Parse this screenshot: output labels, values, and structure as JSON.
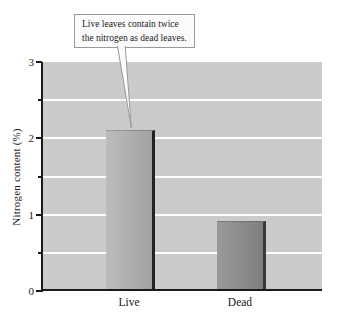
{
  "callout": {
    "lines": [
      "Live leaves contain twice",
      "the nitrogen as dead leaves."
    ]
  },
  "chart_data": {
    "type": "bar",
    "categories": [
      "Live",
      "Dead"
    ],
    "values": [
      2.1,
      0.9
    ],
    "title": "",
    "xlabel": "",
    "ylabel": "Nitrogen content (%)",
    "ylim": [
      0,
      3
    ],
    "ytick_major": [
      0,
      1,
      2,
      3
    ],
    "ytick_minor": [
      0.5,
      1.5,
      2.5
    ],
    "gridline_step": 0.5,
    "grid": "white horizontal gridlines every 0.5 on gray plot background",
    "legend": "none",
    "annotation": "Live leaves contain twice the nitrogen as dead leaves.",
    "annotation_target": "Live",
    "colors": {
      "plot_background": "#cbcbcb",
      "bar_live": "#b4b4b4",
      "bar_dead": "#8d8d8d",
      "bar_edge_live": "#232323",
      "bar_edge_dead": "#3a3a3a",
      "gridline": "#ffffff",
      "axis": "#1a1a1a",
      "callout_background": "#fbfbfb",
      "callout_border": "#999999",
      "text": "#1a1a1a"
    }
  }
}
